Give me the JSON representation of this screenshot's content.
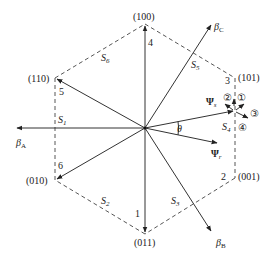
{
  "diagram": {
    "type": "voltage space vector hexagon",
    "vectors": [
      {
        "label": "(100)",
        "index": "4"
      },
      {
        "label": "(101)",
        "index": "3"
      },
      {
        "label": "(001)",
        "index": "2"
      },
      {
        "label": "(011)",
        "index": "1"
      },
      {
        "label": "(010)",
        "index": "6"
      },
      {
        "label": "(110)",
        "index": "5"
      }
    ],
    "sectors": [
      "S",
      "S",
      "S",
      "S",
      "S",
      "S"
    ],
    "sector_subs": [
      "1",
      "2",
      "3",
      "4",
      "5",
      "6"
    ],
    "axes": {
      "A": {
        "base": "β",
        "sub": "A"
      },
      "B": {
        "base": "β",
        "sub": "B"
      },
      "C": {
        "base": "β",
        "sub": "C"
      }
    },
    "stator_flux": {
      "base": "Ψ",
      "sub": "s"
    },
    "rotor_flux": {
      "base": "Ψ",
      "sub": "r"
    },
    "angle": "θ",
    "directions": [
      "①",
      "②",
      "③",
      "④"
    ],
    "colors": {
      "line": "#333333",
      "dash": "#444444",
      "text": "#222222"
    }
  }
}
